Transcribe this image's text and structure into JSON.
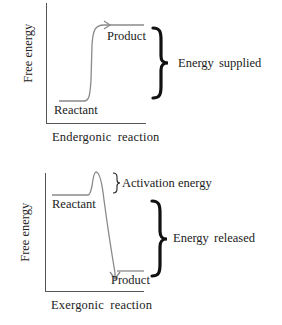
{
  "diagrams": [
    {
      "id": "endergonic",
      "y_axis_label": "Free energy",
      "x_axis_label": "Endergonic reaction",
      "start_label": "Reactant",
      "end_label": "Product",
      "brace_label": "Energy supplied",
      "direction": "uphill"
    },
    {
      "id": "exergonic",
      "y_axis_label": "Free energy",
      "x_axis_label": "Exergonic reaction",
      "start_label": "Reactant",
      "end_label": "Product",
      "activation_label": "Activation energy",
      "brace_label": "Energy released",
      "direction": "downhill"
    }
  ],
  "colors": {
    "axis": "#555555",
    "curve": "#8a8a8a",
    "text": "#222222",
    "brace": "#111111"
  }
}
